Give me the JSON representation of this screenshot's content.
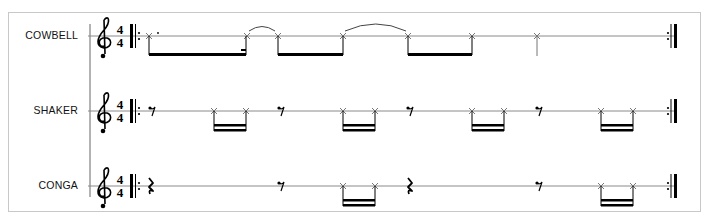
{
  "score": {
    "time_signature": {
      "numerator": "4",
      "denominator": "4"
    },
    "clef": "treble",
    "start_repeat": true,
    "end_repeat": true,
    "instruments": [
      {
        "name": "COWBELL",
        "notes": "x-head eighths/beamed; dotted quarter, tied notes",
        "pattern": [
          "dotted-eighth+sixteenth beam",
          "tie",
          "eighth beam",
          "tie",
          "eighth beam",
          "quarter"
        ]
      },
      {
        "name": "SHAKER",
        "pattern": [
          "eighth rest",
          "sixteenth pair",
          "eighth rest",
          "sixteenth pair",
          "eighth rest",
          "sixteenth pair",
          "eighth rest",
          "sixteenth pair"
        ]
      },
      {
        "name": "CONGA",
        "pattern": [
          "quarter rest",
          "eighth rest",
          "sixteenth pair",
          "quarter rest",
          "eighth rest",
          "sixteenth pair"
        ]
      }
    ]
  },
  "colors": {
    "staff_line": "#8a8a8a",
    "ink": "#000000",
    "notehead": "#777777",
    "frame": "#c8c8c8"
  }
}
